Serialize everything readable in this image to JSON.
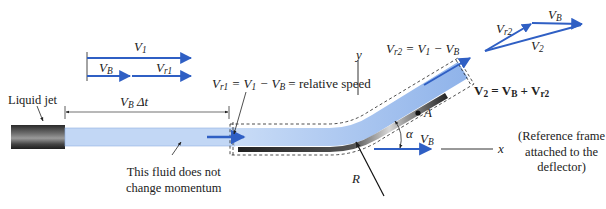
{
  "labels": {
    "liquid_jet": "Liquid jet",
    "vb_dt": {
      "base": "V",
      "sub": "B",
      "tail": " Δt"
    },
    "v1_top": {
      "base": "V",
      "sub": "1"
    },
    "vb_small": {
      "base": "V",
      "sub": "B"
    },
    "vr1_small": {
      "base": "V",
      "sub": "r1"
    },
    "relative_speed": "V_r1 = V_1 − V_B = relative speed",
    "relative_speed_tail": " = relative speed",
    "no_momentum_line1": "This fluid does not",
    "no_momentum_line2": "change momentum",
    "vr2_eq": "V_r2 = V_1 − V_B",
    "y_axis": "y",
    "x_axis": "x",
    "point_a": "A",
    "alpha": "α",
    "radius": "R",
    "vb_deflector": {
      "base": "V",
      "sub": "B"
    },
    "vector_vr2": {
      "base": "V",
      "sub": "r2"
    },
    "vector_vb": {
      "base": "V",
      "sub": "B"
    },
    "vector_v2": {
      "base": "V",
      "sub": "2"
    },
    "v2_sum": "V_2 = V_B + V_r2",
    "reference_line1": "(Reference frame",
    "reference_line2": "attached to the",
    "reference_line3": "deflector)"
  },
  "colors": {
    "vector_blue": "#2f5fc4",
    "jet_fill": "#aac8f0",
    "jet_fill_dark": "#7fa8e6",
    "nozzle": "#3a3a3a",
    "deflector": "#2a2a2a",
    "text": "#222222"
  }
}
